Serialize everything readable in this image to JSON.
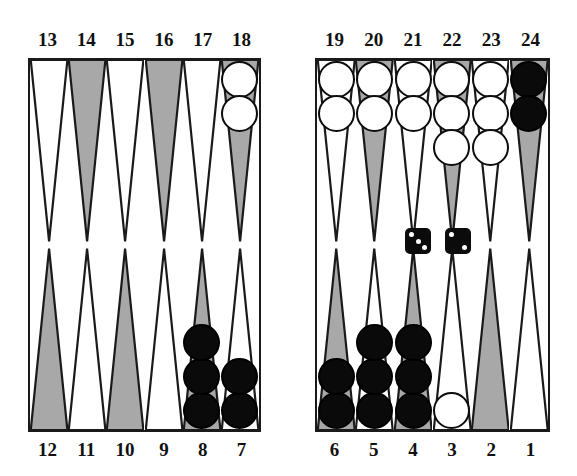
{
  "figure": {
    "kind": "backgammon-board-diagram"
  },
  "colors": {
    "point_shaded": "#a8a8a8",
    "point_plain": "#ffffff",
    "outline": "#1a1a1a",
    "checker_white": "#ffffff",
    "checker_black": "#0a0a0a",
    "background": "#ffffff"
  },
  "labels": {
    "top": [
      "13",
      "14",
      "15",
      "16",
      "17",
      "18",
      "19",
      "20",
      "21",
      "22",
      "23",
      "24"
    ],
    "bottom": [
      "12",
      "11",
      "10",
      "9",
      "8",
      "7",
      "6",
      "5",
      "4",
      "3",
      "2",
      "1"
    ]
  },
  "points": [
    {
      "number": "13",
      "quadrant": "top-left",
      "slot": 0,
      "shaded": false,
      "checkers": 0,
      "color": ""
    },
    {
      "number": "14",
      "quadrant": "top-left",
      "slot": 1,
      "shaded": true,
      "checkers": 0,
      "color": ""
    },
    {
      "number": "15",
      "quadrant": "top-left",
      "slot": 2,
      "shaded": false,
      "checkers": 0,
      "color": ""
    },
    {
      "number": "16",
      "quadrant": "top-left",
      "slot": 3,
      "shaded": true,
      "checkers": 0,
      "color": ""
    },
    {
      "number": "17",
      "quadrant": "top-left",
      "slot": 4,
      "shaded": false,
      "checkers": 0,
      "color": ""
    },
    {
      "number": "18",
      "quadrant": "top-left",
      "slot": 5,
      "shaded": true,
      "checkers": 2,
      "color": "white"
    },
    {
      "number": "19",
      "quadrant": "top-right",
      "slot": 0,
      "shaded": false,
      "checkers": 2,
      "color": "white"
    },
    {
      "number": "20",
      "quadrant": "top-right",
      "slot": 1,
      "shaded": true,
      "checkers": 2,
      "color": "white"
    },
    {
      "number": "21",
      "quadrant": "top-right",
      "slot": 2,
      "shaded": false,
      "checkers": 2,
      "color": "white"
    },
    {
      "number": "22",
      "quadrant": "top-right",
      "slot": 3,
      "shaded": true,
      "checkers": 3,
      "color": "white"
    },
    {
      "number": "23",
      "quadrant": "top-right",
      "slot": 4,
      "shaded": false,
      "checkers": 3,
      "color": "white"
    },
    {
      "number": "24",
      "quadrant": "top-right",
      "slot": 5,
      "shaded": true,
      "checkers": 2,
      "color": "black"
    },
    {
      "number": "12",
      "quadrant": "bottom-left",
      "slot": 0,
      "shaded": true,
      "checkers": 0,
      "color": ""
    },
    {
      "number": "11",
      "quadrant": "bottom-left",
      "slot": 1,
      "shaded": false,
      "checkers": 0,
      "color": ""
    },
    {
      "number": "10",
      "quadrant": "bottom-left",
      "slot": 2,
      "shaded": true,
      "checkers": 0,
      "color": ""
    },
    {
      "number": "9",
      "quadrant": "bottom-left",
      "slot": 3,
      "shaded": false,
      "checkers": 0,
      "color": ""
    },
    {
      "number": "8",
      "quadrant": "bottom-left",
      "slot": 4,
      "shaded": true,
      "checkers": 3,
      "color": "black"
    },
    {
      "number": "7",
      "quadrant": "bottom-left",
      "slot": 5,
      "shaded": false,
      "checkers": 2,
      "color": "black"
    },
    {
      "number": "6",
      "quadrant": "bottom-right",
      "slot": 0,
      "shaded": true,
      "checkers": 2,
      "color": "black"
    },
    {
      "number": "5",
      "quadrant": "bottom-right",
      "slot": 1,
      "shaded": false,
      "checkers": 3,
      "color": "black"
    },
    {
      "number": "4",
      "quadrant": "bottom-right",
      "slot": 2,
      "shaded": true,
      "checkers": 3,
      "color": "black"
    },
    {
      "number": "3",
      "quadrant": "bottom-right",
      "slot": 3,
      "shaded": false,
      "checkers": 1,
      "color": "white"
    },
    {
      "number": "2",
      "quadrant": "bottom-right",
      "slot": 4,
      "shaded": true,
      "checkers": 0,
      "color": ""
    },
    {
      "number": "1",
      "quadrant": "bottom-right",
      "slot": 5,
      "shaded": false,
      "checkers": 0,
      "color": ""
    }
  ],
  "dice": [
    {
      "name": "die-left",
      "value": 3
    },
    {
      "name": "die-right",
      "value": 2
    }
  ],
  "totals": {
    "white_on_board": 15,
    "black_on_board": 15
  }
}
